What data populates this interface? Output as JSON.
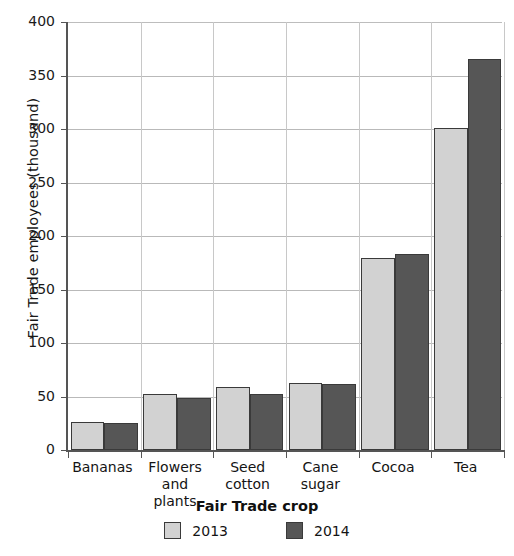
{
  "chart_data": {
    "type": "bar",
    "title": "",
    "xlabel": "Fair Trade crop",
    "ylabel": "Fair Trade employees (thousand)",
    "categories": [
      "Bananas",
      "Flowers and plants",
      "Seed cotton",
      "Cane sugar",
      "Cocoa",
      "Tea"
    ],
    "category_lines": [
      [
        "Bananas"
      ],
      [
        "Flowers",
        "and plants"
      ],
      [
        "Seed",
        "cotton"
      ],
      [
        "Cane",
        "sugar"
      ],
      [
        "Cocoa"
      ],
      [
        "Tea"
      ]
    ],
    "series": [
      {
        "name": "2013",
        "color": "#d2d2d2",
        "values": [
          26,
          52,
          59,
          63,
          179,
          301
        ]
      },
      {
        "name": "2014",
        "color": "#565656",
        "values": [
          25,
          49,
          52,
          62,
          183,
          365
        ]
      }
    ],
    "ylim": [
      0,
      400
    ],
    "yticks": [
      0,
      50,
      100,
      150,
      200,
      250,
      300,
      350,
      400
    ],
    "ytick_labels": [
      "0",
      "50",
      "100",
      "150",
      "200",
      "250",
      "300",
      "350",
      "400"
    ],
    "grid": "horizontal-and-vertical",
    "legend_position": "bottom",
    "legend": [
      "2013",
      "2014"
    ]
  }
}
